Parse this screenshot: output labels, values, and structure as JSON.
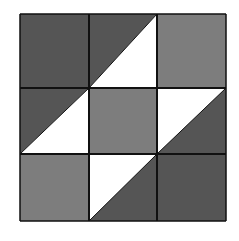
{
  "colors": {
    "dark": "#555555",
    "medium": "#7d7d7d",
    "light": "#ffffff",
    "line": "#111111"
  },
  "grid": {
    "rows": 3,
    "cols": 3,
    "x_lines": [
      20,
      89,
      157,
      226
    ],
    "y_lines": [
      14,
      88,
      154,
      221
    ]
  },
  "cells": [
    {
      "row": 0,
      "col": 0,
      "type": "solid",
      "fill": "dark"
    },
    {
      "row": 0,
      "col": 1,
      "type": "half-square",
      "diagonal": "tr-bl",
      "upper": "dark",
      "lower": "light"
    },
    {
      "row": 0,
      "col": 2,
      "type": "solid",
      "fill": "medium"
    },
    {
      "row": 1,
      "col": 0,
      "type": "half-square",
      "diagonal": "tr-bl",
      "upper": "dark",
      "lower": "light"
    },
    {
      "row": 1,
      "col": 1,
      "type": "solid",
      "fill": "medium"
    },
    {
      "row": 1,
      "col": 2,
      "type": "half-square",
      "diagonal": "tr-bl",
      "upper": "light",
      "lower": "dark"
    },
    {
      "row": 2,
      "col": 0,
      "type": "solid",
      "fill": "medium"
    },
    {
      "row": 2,
      "col": 1,
      "type": "half-square",
      "diagonal": "tr-bl",
      "upper": "light",
      "lower": "dark"
    },
    {
      "row": 2,
      "col": 2,
      "type": "solid",
      "fill": "dark"
    }
  ]
}
